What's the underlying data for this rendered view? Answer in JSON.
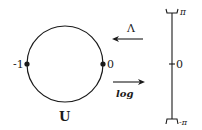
{
  "diagram": {
    "circle_label": "U",
    "circle_points": [
      {
        "label": "-1"
      },
      {
        "label": "0"
      }
    ],
    "arrows": [
      {
        "label": "Λ",
        "direction": "left"
      },
      {
        "label": "log",
        "direction": "right"
      }
    ],
    "interval": {
      "top_label": "π",
      "middle_label": "0",
      "bottom_label": "-π"
    },
    "colors": {
      "ink": "#1a1a1a",
      "background": "#ffffff"
    }
  }
}
